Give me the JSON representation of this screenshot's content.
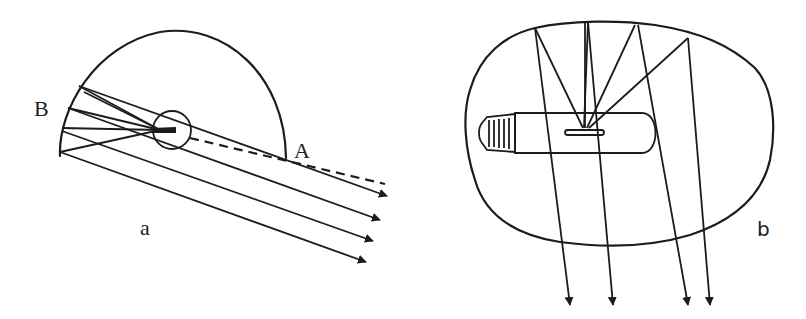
{
  "figure": {
    "panels": [
      {
        "id": "a",
        "caption": "a",
        "labels": {
          "point_b": "B",
          "point_a": "A"
        },
        "description": "Hemispherical reflector with light source at focus; reflected rays leave parallel, dashed axis line passes through A"
      },
      {
        "id": "b",
        "caption": "b",
        "description": "Irregular reflector enclosing a tubular lamp with filament; rays reflect off top and exit downward as arrows"
      }
    ],
    "colors": {
      "ink": "#1c1c1c",
      "background": "#ffffff"
    }
  }
}
